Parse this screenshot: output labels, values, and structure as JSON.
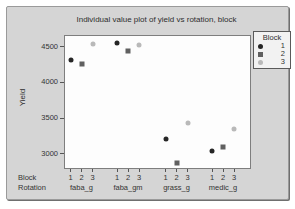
{
  "chart_data": {
    "type": "scatter",
    "title": "Individual value plot of yield vs rotation, block",
    "ylabel": "Yield",
    "ylim": [
      2800,
      4650
    ],
    "yticks": [
      4500,
      4000,
      3500,
      3000
    ],
    "grid": false,
    "legend_title": "Block",
    "legend_position": "top-right-outside",
    "xlabel_rows": {
      "block": "Block",
      "rotation": "Rotation"
    },
    "categories": [
      "faba_g",
      "faba_gm",
      "grass_g",
      "medic_g"
    ],
    "block_levels": [
      "1",
      "2",
      "3"
    ],
    "series": [
      {
        "name": "1",
        "marker": "circle",
        "color": "#262626",
        "values": [
          4310,
          4550,
          3200,
          3040
        ]
      },
      {
        "name": "2",
        "marker": "square",
        "color": "#606060",
        "values": [
          4260,
          4440,
          2870,
          3100
        ]
      },
      {
        "name": "3",
        "marker": "circle",
        "color": "#b9b9b9",
        "values": [
          4540,
          4520,
          3430,
          3340
        ]
      }
    ]
  },
  "colors": {
    "panel_background": "#d5d5d5",
    "plot_background": "#fdfdfd",
    "border": "#7e7e7e",
    "text": "#333333"
  }
}
